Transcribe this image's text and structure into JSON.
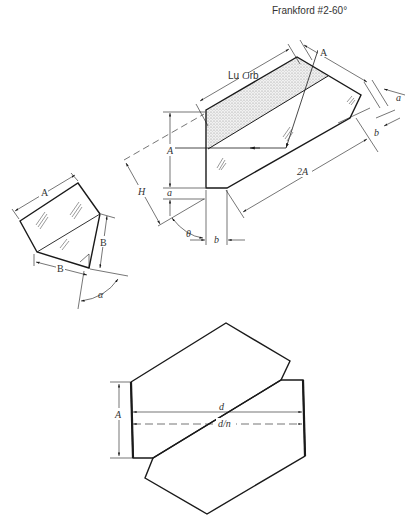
{
  "header": {
    "title": "Frankford #2-60°"
  },
  "figures": {
    "luxorb": {
      "label": "Luxorb",
      "dimensions": {
        "C": "C",
        "A_top": "A",
        "a_right": "a",
        "b_right": "b",
        "A_left": "A",
        "a_left": "a",
        "H": "H",
        "two_A": "2A",
        "theta": "θ",
        "b_bottom": "b"
      }
    },
    "pentaprism": {
      "dimensions": {
        "A": "A",
        "B_right": "B",
        "B_bottom": "B",
        "alpha": "α"
      }
    },
    "combined_prism": {
      "dimensions": {
        "A": "A",
        "d": "d",
        "d_over_n": "d/n"
      }
    }
  },
  "colors": {
    "line": "#1a1a1a",
    "stipple": "#cfcfcf",
    "text": "#333333",
    "background": "#ffffff"
  }
}
